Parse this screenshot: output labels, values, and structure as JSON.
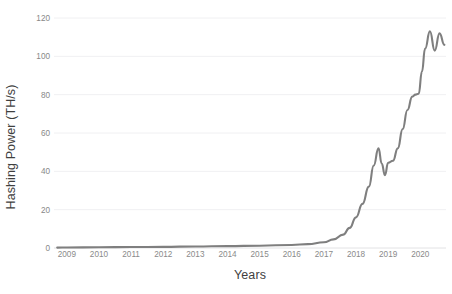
{
  "chart_data": {
    "type": "line",
    "title": "",
    "xlabel": "Years",
    "ylabel": "Hashing Power (TH/s)",
    "xlim": [
      2008.6,
      2020.8
    ],
    "ylim": [
      0,
      120
    ],
    "grid": true,
    "legend": null,
    "legend_position": "none",
    "line_color": "#7f7f7f",
    "gridline_color": "#f0f0f2",
    "tick_label_color": "#8a8a8a",
    "axis_title_color": "#3f3f3f",
    "x_ticks": [
      2009,
      2010,
      2011,
      2012,
      2013,
      2014,
      2015,
      2016,
      2017,
      2018,
      2019,
      2020
    ],
    "x_tick_labels": [
      "2009",
      "2010",
      "2011",
      "2012",
      "2013",
      "2014",
      "2015",
      "2016",
      "2017",
      "2018",
      "2019",
      "2020"
    ],
    "y_ticks": [
      0,
      20,
      40,
      60,
      80,
      100,
      120
    ],
    "y_tick_labels": [
      "0",
      "20",
      "40",
      "60",
      "80",
      "100",
      "120"
    ],
    "series": [
      {
        "name": "Hashing Power",
        "x": [
          2008.7,
          2009.0,
          2010.0,
          2011.0,
          2012.0,
          2013.0,
          2014.0,
          2015.0,
          2016.0,
          2016.5,
          2017.0,
          2017.3,
          2017.6,
          2017.8,
          2018.0,
          2018.2,
          2018.4,
          2018.55,
          2018.7,
          2018.8,
          2018.9,
          2019.0,
          2019.15,
          2019.3,
          2019.45,
          2019.6,
          2019.75,
          2019.85,
          2019.95,
          2020.05,
          2020.15,
          2020.3,
          2020.45,
          2020.6,
          2020.75
        ],
        "y": [
          0.2,
          0.3,
          0.4,
          0.5,
          0.6,
          0.8,
          1.0,
          1.2,
          1.6,
          2.0,
          3.0,
          4.5,
          7.0,
          10.5,
          16.0,
          23.0,
          32.0,
          43.0,
          52.0,
          44.0,
          38.0,
          44.5,
          45.5,
          52.0,
          62.0,
          72.0,
          79.0,
          80.0,
          80.5,
          92.0,
          104.0,
          113.0,
          103.0,
          112.0,
          106.0
        ]
      }
    ]
  }
}
